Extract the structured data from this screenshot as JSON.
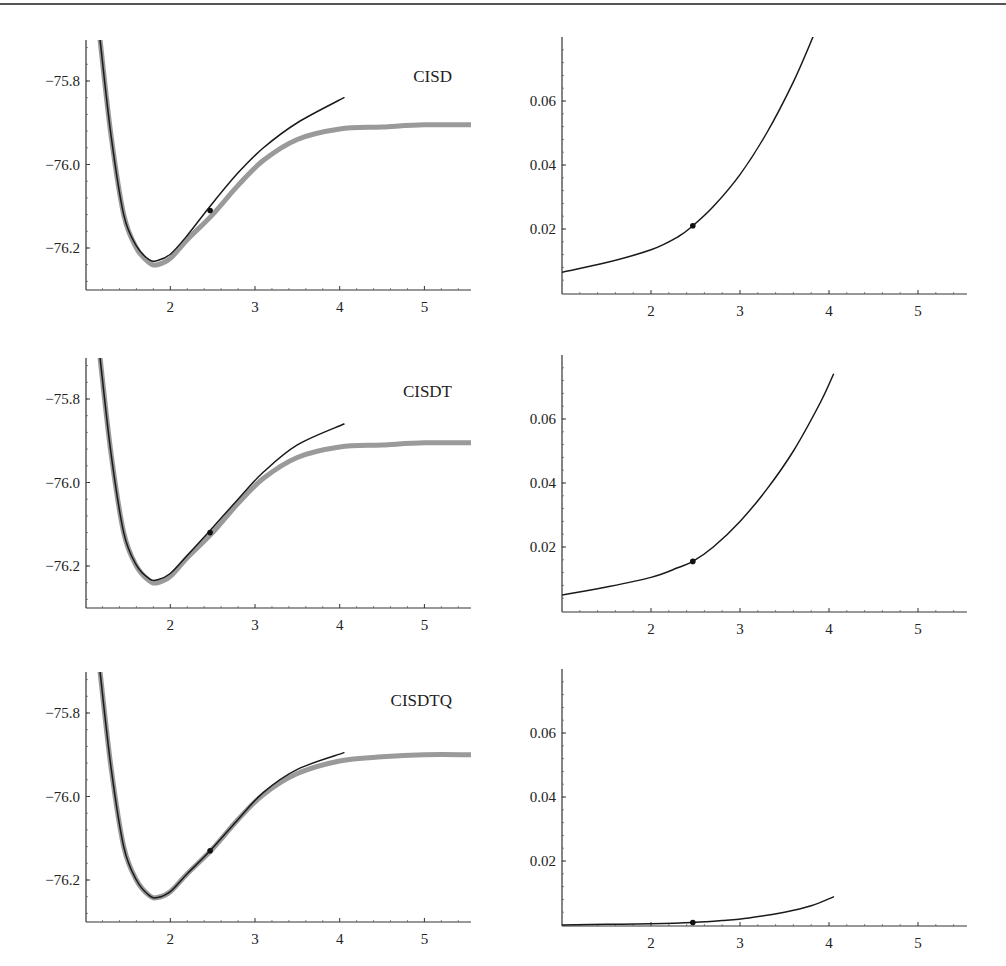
{
  "chart_data": [
    {
      "type": "line",
      "panel": "top-left",
      "label": "CISD",
      "xlabel": "",
      "ylabel": "",
      "xlim": [
        1.0,
        5.55
      ],
      "ylim": [
        -76.3,
        -75.7
      ],
      "x_ticks": [
        "2",
        "3",
        "4",
        "5"
      ],
      "y_ticks": [
        "-75.8",
        "-76.0",
        "-76.2"
      ],
      "series": [
        {
          "name": "exact (gray, thick)",
          "color": "#9a9a9a",
          "x": [
            1.17,
            1.3,
            1.45,
            1.6,
            1.75,
            1.85,
            2.0,
            2.2,
            2.5,
            2.8,
            3.1,
            3.5,
            4.0,
            4.5,
            5.0,
            5.55
          ],
          "y": [
            -75.7,
            -75.93,
            -76.12,
            -76.2,
            -76.235,
            -76.24,
            -76.225,
            -76.18,
            -76.12,
            -76.05,
            -75.99,
            -75.94,
            -75.915,
            -75.91,
            -75.905,
            -75.905
          ]
        },
        {
          "name": "CISD (black)",
          "color": "#1a1a1a",
          "x": [
            1.17,
            1.3,
            1.45,
            1.6,
            1.75,
            1.85,
            2.0,
            2.2,
            2.47,
            2.8,
            3.1,
            3.5,
            4.05
          ],
          "y": [
            -75.7,
            -75.93,
            -76.12,
            -76.195,
            -76.228,
            -76.23,
            -76.215,
            -76.17,
            -76.1,
            -76.02,
            -75.96,
            -75.9,
            -75.84
          ]
        }
      ],
      "marker": {
        "x": 2.47,
        "y": -76.11
      }
    },
    {
      "type": "line",
      "panel": "top-right",
      "xlim": [
        1.0,
        5.55
      ],
      "ylim": [
        0,
        0.08
      ],
      "x_ticks": [
        "2",
        "3",
        "4",
        "5"
      ],
      "y_ticks": [
        "0.02",
        "0.04",
        "0.06"
      ],
      "series": [
        {
          "name": "CISD error",
          "color": "#1a1a1a",
          "x": [
            1.0,
            1.5,
            2.0,
            2.3,
            2.47,
            2.7,
            3.0,
            3.3,
            3.6,
            3.82
          ],
          "y": [
            0.0065,
            0.0095,
            0.0135,
            0.0175,
            0.021,
            0.027,
            0.037,
            0.05,
            0.066,
            0.08
          ]
        }
      ],
      "marker": {
        "x": 2.47,
        "y": 0.021
      }
    },
    {
      "type": "line",
      "panel": "middle-left",
      "label": "CISDT",
      "xlim": [
        1.0,
        5.55
      ],
      "ylim": [
        -76.3,
        -75.7
      ],
      "x_ticks": [
        "2",
        "3",
        "4",
        "5"
      ],
      "y_ticks": [
        "-75.8",
        "-76.0",
        "-76.2"
      ],
      "series": [
        {
          "name": "exact (gray, thick)",
          "color": "#9a9a9a",
          "x": [
            1.17,
            1.3,
            1.45,
            1.6,
            1.75,
            1.85,
            2.0,
            2.2,
            2.5,
            2.8,
            3.1,
            3.5,
            4.0,
            4.5,
            5.0,
            5.55
          ],
          "y": [
            -75.7,
            -75.93,
            -76.12,
            -76.2,
            -76.235,
            -76.24,
            -76.225,
            -76.18,
            -76.12,
            -76.05,
            -75.99,
            -75.94,
            -75.915,
            -75.91,
            -75.905,
            -75.905
          ]
        },
        {
          "name": "CISDT (black)",
          "color": "#1a1a1a",
          "x": [
            1.17,
            1.3,
            1.45,
            1.6,
            1.75,
            1.85,
            2.0,
            2.2,
            2.47,
            2.8,
            3.1,
            3.5,
            4.05
          ],
          "y": [
            -75.7,
            -75.93,
            -76.12,
            -76.198,
            -76.23,
            -76.233,
            -76.218,
            -76.175,
            -76.115,
            -76.04,
            -75.975,
            -75.91,
            -75.86
          ]
        }
      ],
      "marker": {
        "x": 2.47,
        "y": -76.12
      }
    },
    {
      "type": "line",
      "panel": "middle-right",
      "xlim": [
        1.0,
        5.55
      ],
      "ylim": [
        0,
        0.08
      ],
      "x_ticks": [
        "2",
        "3",
        "4",
        "5"
      ],
      "y_ticks": [
        "0.02",
        "0.04",
        "0.06"
      ],
      "series": [
        {
          "name": "CISDT error",
          "color": "#1a1a1a",
          "x": [
            1.0,
            1.5,
            2.0,
            2.3,
            2.47,
            2.7,
            3.0,
            3.3,
            3.6,
            3.9,
            4.05
          ],
          "y": [
            0.005,
            0.0075,
            0.0105,
            0.0135,
            0.0155,
            0.02,
            0.028,
            0.038,
            0.05,
            0.065,
            0.074
          ]
        }
      ],
      "marker": {
        "x": 2.47,
        "y": 0.0155
      }
    },
    {
      "type": "line",
      "panel": "bottom-left",
      "label": "CISDTQ",
      "xlim": [
        1.0,
        5.55
      ],
      "ylim": [
        -76.3,
        -75.7
      ],
      "x_ticks": [
        "2",
        "3",
        "4",
        "5"
      ],
      "y_ticks": [
        "-75.8",
        "-76.0",
        "-76.2"
      ],
      "series": [
        {
          "name": "exact (gray, thick)",
          "color": "#9a9a9a",
          "x": [
            1.17,
            1.3,
            1.45,
            1.6,
            1.75,
            1.85,
            2.0,
            2.2,
            2.5,
            2.8,
            3.1,
            3.5,
            4.0,
            4.5,
            5.0,
            5.55
          ],
          "y": [
            -75.7,
            -75.93,
            -76.12,
            -76.2,
            -76.237,
            -76.242,
            -76.228,
            -76.185,
            -76.125,
            -76.055,
            -75.995,
            -75.945,
            -75.915,
            -75.905,
            -75.9,
            -75.9
          ]
        },
        {
          "name": "CISDTQ (black)",
          "color": "#1a1a1a",
          "x": [
            1.17,
            1.3,
            1.45,
            1.6,
            1.75,
            1.85,
            2.0,
            2.2,
            2.47,
            2.8,
            3.1,
            3.5,
            4.05
          ],
          "y": [
            -75.7,
            -75.93,
            -76.12,
            -76.2,
            -76.237,
            -76.242,
            -76.228,
            -76.185,
            -76.13,
            -76.055,
            -75.99,
            -75.935,
            -75.895
          ]
        }
      ],
      "marker": {
        "x": 2.47,
        "y": -76.13
      }
    },
    {
      "type": "line",
      "panel": "bottom-right",
      "xlim": [
        1.0,
        5.55
      ],
      "ylim": [
        0,
        0.08
      ],
      "x_ticks": [
        "2",
        "3",
        "4",
        "5"
      ],
      "y_ticks": [
        "0.02",
        "0.04",
        "0.06"
      ],
      "series": [
        {
          "name": "CISDTQ error",
          "color": "#1a1a1a",
          "x": [
            1.0,
            1.5,
            2.0,
            2.47,
            2.8,
            3.1,
            3.5,
            3.8,
            4.05
          ],
          "y": [
            0.0,
            0.0002,
            0.0004,
            0.0008,
            0.0014,
            0.0022,
            0.004,
            0.006,
            0.0088
          ]
        }
      ],
      "marker": {
        "x": 2.47,
        "y": 0.0008
      }
    }
  ],
  "labels": {
    "panel_1": "CISD",
    "panel_2": "CISDT",
    "panel_3": "CISDTQ",
    "energy_ticks": [
      "−75.8",
      "−76.0",
      "−76.2"
    ],
    "error_ticks": [
      "0.06",
      "0.04",
      "0.02"
    ],
    "x_ticks": [
      "2",
      "3",
      "4",
      "5"
    ]
  }
}
